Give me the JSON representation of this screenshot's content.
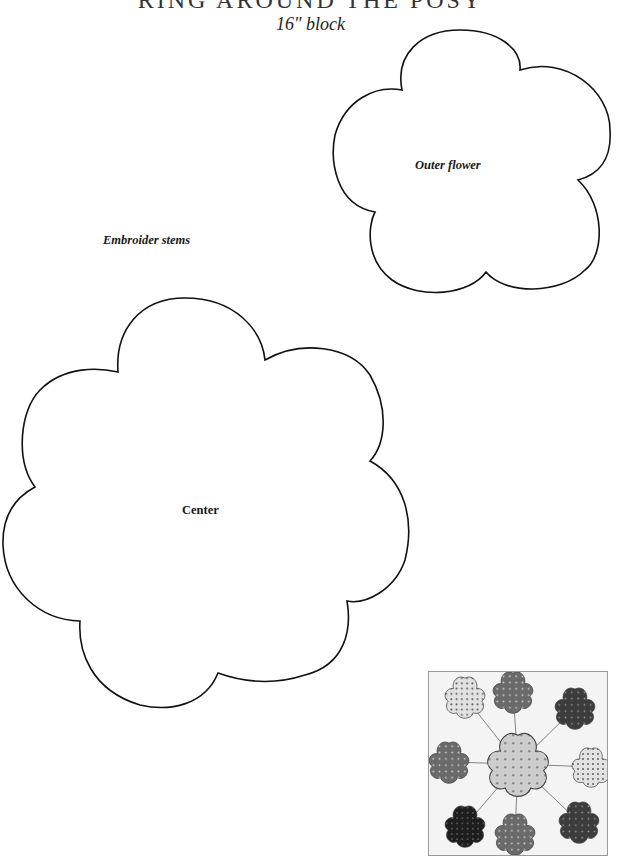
{
  "page": {
    "title": "RING AROUND THE POSY",
    "subtitle": "16″ block"
  },
  "templates": {
    "outer_flower": {
      "label": "Outer flower",
      "petals": 5
    },
    "center": {
      "label": "Center",
      "petals": 7
    }
  },
  "notes": {
    "embroider": "Embroider stems"
  },
  "thumbnail": {
    "description": "Finished block preview: center flower with 8 outer flowers connected by embroidered stems",
    "outer_flower_count": 8,
    "colors": {
      "light_print": "#d8d8d8",
      "medium_print": "#6e6e6e",
      "dark_print": "#3c3c3c",
      "black_print": "#1e1e1e",
      "center_print": "#c9c9c9"
    }
  }
}
